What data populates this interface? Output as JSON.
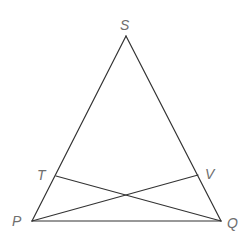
{
  "diagram": {
    "type": "geometry",
    "colors": {
      "line": "#333333",
      "label": "#6e6e6e",
      "background": "#ffffff"
    },
    "points": {
      "S": {
        "label": "S",
        "x": 126,
        "y": 36,
        "label_x": 120,
        "label_y": 30
      },
      "P": {
        "label": "P",
        "x": 32,
        "y": 221,
        "label_x": 12,
        "label_y": 226
      },
      "Q": {
        "label": "Q",
        "x": 221,
        "y": 221,
        "label_x": 227,
        "label_y": 228
      },
      "T": {
        "label": "T",
        "x": 56,
        "y": 176,
        "label_x": 37,
        "label_y": 180
      },
      "V": {
        "label": "V",
        "x": 198,
        "y": 175,
        "label_x": 205,
        "label_y": 179
      }
    },
    "segments": [
      {
        "from": "P",
        "to": "S"
      },
      {
        "from": "S",
        "to": "Q"
      },
      {
        "from": "P",
        "to": "Q"
      },
      {
        "from": "T",
        "to": "Q"
      },
      {
        "from": "P",
        "to": "V"
      }
    ]
  }
}
